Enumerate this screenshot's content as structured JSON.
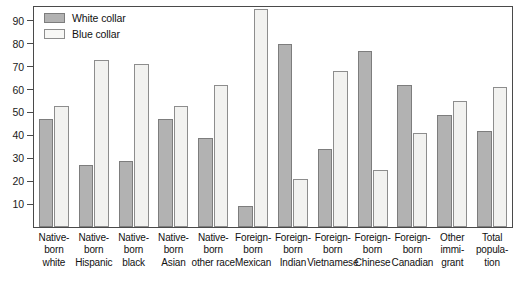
{
  "chart_data": {
    "type": "bar",
    "title": "",
    "subtitle": "",
    "xlabel": "",
    "ylabel": "",
    "ylim": [
      0,
      96
    ],
    "yticks": [
      10,
      20,
      30,
      40,
      50,
      60,
      70,
      80,
      90
    ],
    "grid": false,
    "legend_position": "top-left",
    "categories": [
      "Native-born white",
      "Native-born Hispanic",
      "Native-born black",
      "Native-born Asian",
      "Native-born other race",
      "Foreign-born Mexican",
      "Foreign-born Indian",
      "Foreign-born Vietnamese",
      "Foreign-born Chinese",
      "Foreign-born Canadian",
      "Other immigrant",
      "Total population"
    ],
    "category_lines": [
      [
        "Native-",
        "born",
        "white"
      ],
      [
        "Native-",
        "born",
        "Hispanic"
      ],
      [
        "Native-",
        "born",
        "black"
      ],
      [
        "Native-",
        "born",
        "Asian"
      ],
      [
        "Native-",
        "born",
        "other race"
      ],
      [
        "Foreign-",
        "born",
        "Mexican"
      ],
      [
        "Foreign-",
        "born",
        "Indian"
      ],
      [
        "Foreign-",
        "born",
        "Vietnamese"
      ],
      [
        "Foreign-",
        "born",
        "Chinese"
      ],
      [
        "Foreign-",
        "born",
        "Canadian"
      ],
      [
        "Other",
        "immi-",
        "grant"
      ],
      [
        "Total",
        "popula-",
        "tion"
      ]
    ],
    "series": [
      {
        "name": "White collar",
        "color": "#b2b2b2",
        "values": [
          47,
          27,
          29,
          47,
          39,
          9,
          80,
          34,
          77,
          62,
          49,
          42
        ]
      },
      {
        "name": "Blue collar",
        "color": "#f2f2f0",
        "values": [
          53,
          73,
          71,
          53,
          62,
          95,
          21,
          68,
          25,
          41,
          55,
          61
        ]
      }
    ]
  },
  "legend": {
    "items": [
      {
        "label": "White collar",
        "swatch": "white-collar"
      },
      {
        "label": "Blue collar",
        "swatch": "blue-collar"
      }
    ]
  }
}
